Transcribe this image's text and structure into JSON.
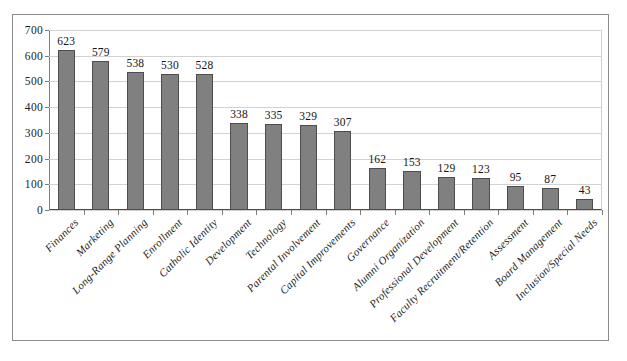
{
  "chart_data": {
    "type": "bar",
    "title": "",
    "xlabel": "",
    "ylabel": "",
    "ylim": [
      0,
      700
    ],
    "yticks": [
      0,
      100,
      200,
      300,
      400,
      500,
      600,
      700
    ],
    "grid": true,
    "legend": false,
    "bar_color": "#808080",
    "bar_edge_color": "#4d4d4d",
    "categories": [
      "Finances",
      "Marketing",
      "Long-Range Planning",
      "Enrollment",
      "Catholic Identity",
      "Development",
      "Technology",
      "Parental Involvement",
      "Capital Improvements",
      "Governance",
      "Alumni Organization",
      "Professional Development",
      "Faculty Recruitment/Retention",
      "Assessment",
      "Board Management",
      "Inclusion/Special Needs"
    ],
    "values": [
      623,
      579,
      538,
      530,
      528,
      338,
      335,
      329,
      307,
      162,
      153,
      129,
      123,
      95,
      87,
      43
    ],
    "data_labels": [
      "623",
      "579",
      "538",
      "530",
      "528",
      "338",
      "335",
      "329",
      "307",
      "162",
      "153",
      "129",
      "123",
      "95",
      "87",
      "43"
    ],
    "ytick_labels": [
      "0",
      "100",
      "200",
      "300",
      "400",
      "500",
      "600",
      "700"
    ]
  }
}
